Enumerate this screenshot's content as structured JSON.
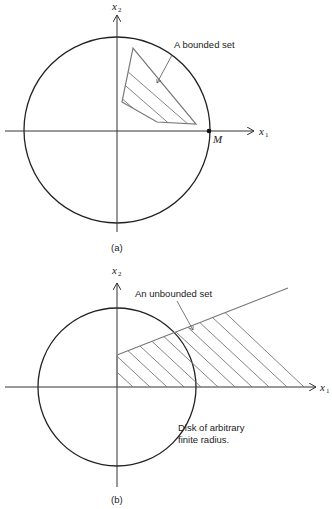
{
  "figure_a": {
    "caption": "(a)",
    "x_axis_label": "x",
    "x_axis_sub": "1",
    "y_axis_label": "x",
    "y_axis_sub": "2",
    "set_label": "A bounded set",
    "point_label": "M",
    "colors": {
      "circle": "#222222",
      "set": "#777777",
      "axis": "#333333"
    }
  },
  "figure_b": {
    "caption": "(b)",
    "x_axis_label": "x",
    "x_axis_sub": "1",
    "y_axis_label": "x",
    "y_axis_sub": "2",
    "set_label": "An unbounded set",
    "disk_label_line1": "Disk of arbitrary",
    "disk_label_line2": "finite radius.",
    "colors": {
      "circle": "#222222",
      "set": "#777777",
      "axis": "#333333"
    }
  }
}
